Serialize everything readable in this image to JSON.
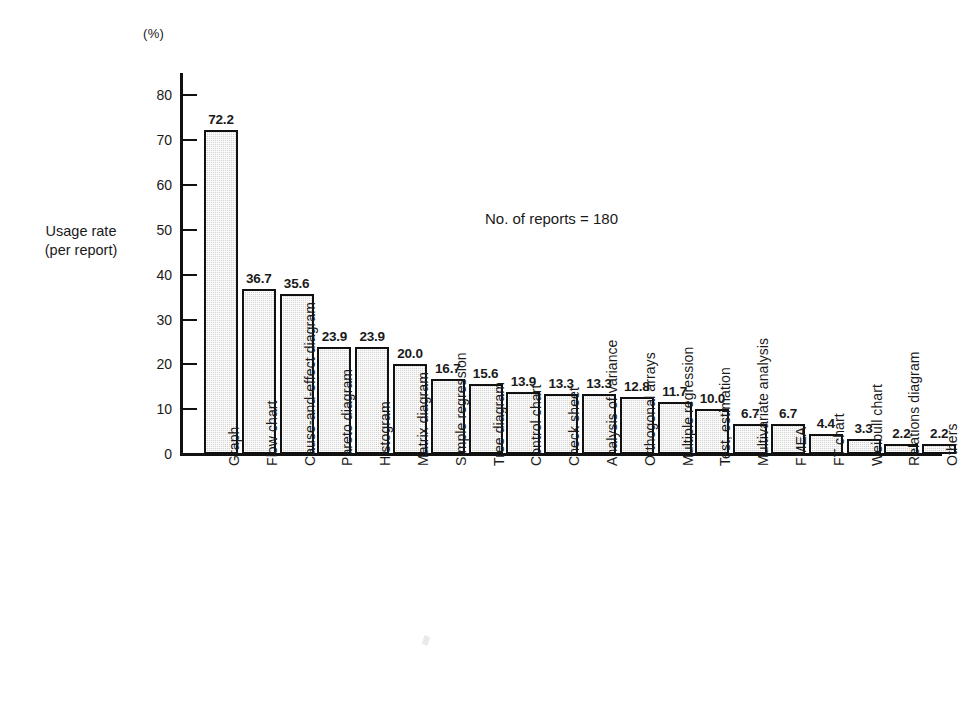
{
  "chart_data": {
    "type": "bar",
    "title": "",
    "unit_label": "(%)",
    "xlabel": "",
    "ylabel": "Usage rate (per report)",
    "ylabel_line1": "Usage rate",
    "ylabel_line2": "(per report)",
    "annotation": "No. of reports = 180",
    "ylim": [
      0,
      85
    ],
    "yticks": [
      0,
      10,
      20,
      30,
      40,
      50,
      60,
      70,
      80
    ],
    "ytick_labels": [
      "0",
      "10",
      "20",
      "30",
      "40",
      "50",
      "60",
      "70",
      "80"
    ],
    "grid": false,
    "legend": false,
    "bar_fill": "#d2d2d2",
    "bar_edge": "#111111",
    "categories": [
      "Graph",
      "Flow chart",
      "Cause-and-effect diagram",
      "Pareto diagram",
      "Histogram",
      "Matrix diagram",
      "Simple regression",
      "Tree diagram",
      "Control chart",
      "Check sheet",
      "Analysis of variance",
      "Orthogonal arrays",
      "Multiple regression",
      "Test, estimation",
      "Multivariate analysis",
      "FMEA",
      "FT chart",
      "Weibull chart",
      "Relations diagram",
      "Others"
    ],
    "values": [
      72.2,
      36.7,
      35.6,
      23.9,
      23.9,
      20.0,
      16.7,
      15.6,
      13.9,
      13.3,
      13.3,
      12.8,
      11.7,
      10.0,
      6.7,
      6.7,
      4.4,
      3.3,
      2.2,
      2.2
    ],
    "value_labels": [
      "72.2",
      "36.7",
      "35.6",
      "23.9",
      "23.9",
      "20.0",
      "16.7",
      "15.6",
      "13.9",
      "13.3",
      "13.3",
      "12.8",
      "11.7",
      "10.0",
      "6.7",
      "6.7",
      "4.4",
      "3.3",
      "2.2",
      "2.2"
    ]
  }
}
